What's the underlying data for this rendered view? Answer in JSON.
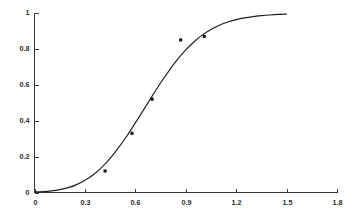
{
  "chart_data": {
    "type": "line",
    "title": "",
    "subtitle": "",
    "xlabel": "",
    "ylabel": "",
    "xlim": [
      0,
      1.8
    ],
    "ylim": [
      0,
      1
    ],
    "grid": false,
    "legend": null,
    "x_ticks": [
      "0",
      "0.3",
      "0.6",
      "0.9",
      "1.2",
      "1.5",
      "1.8"
    ],
    "x_tick_values": [
      0,
      0.3,
      0.6,
      0.9,
      1.2,
      1.5,
      1.8
    ],
    "y_ticks": [
      "0",
      "0.2",
      "0.4",
      "0.6",
      "0.8",
      "1"
    ],
    "y_tick_values": [
      0,
      0.2,
      0.4,
      0.6,
      0.8,
      1
    ],
    "series": [
      {
        "name": "fitted-sigmoid-curve",
        "type": "line",
        "color": "#1f1f1f",
        "x_start": 0,
        "x_end": 1.5,
        "points": [
          [
            0.0,
            0.003
          ],
          [
            0.05,
            0.005
          ],
          [
            0.1,
            0.009
          ],
          [
            0.15,
            0.016
          ],
          [
            0.2,
            0.027
          ],
          [
            0.25,
            0.044
          ],
          [
            0.3,
            0.068
          ],
          [
            0.35,
            0.099
          ],
          [
            0.4,
            0.14
          ],
          [
            0.45,
            0.19
          ],
          [
            0.5,
            0.25
          ],
          [
            0.55,
            0.315
          ],
          [
            0.6,
            0.388
          ],
          [
            0.65,
            0.462
          ],
          [
            0.7,
            0.537
          ],
          [
            0.75,
            0.61
          ],
          [
            0.8,
            0.678
          ],
          [
            0.85,
            0.74
          ],
          [
            0.9,
            0.794
          ],
          [
            0.95,
            0.84
          ],
          [
            1.0,
            0.878
          ],
          [
            1.05,
            0.908
          ],
          [
            1.1,
            0.932
          ],
          [
            1.15,
            0.95
          ],
          [
            1.2,
            0.963
          ],
          [
            1.25,
            0.973
          ],
          [
            1.3,
            0.98
          ],
          [
            1.35,
            0.985
          ],
          [
            1.4,
            0.989
          ],
          [
            1.45,
            0.992
          ],
          [
            1.5,
            0.994
          ]
        ]
      },
      {
        "name": "measured-data-points",
        "type": "scatter",
        "color": "#121212",
        "marker": "filled-square",
        "points": [
          [
            0.42,
            0.12
          ],
          [
            0.58,
            0.33
          ],
          [
            0.7,
            0.52
          ],
          [
            0.87,
            0.85
          ],
          [
            1.01,
            0.87
          ]
        ]
      }
    ]
  }
}
